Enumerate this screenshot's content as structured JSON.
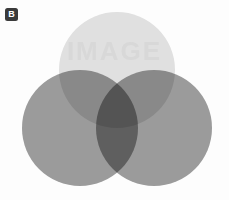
{
  "panel": {
    "label": "B",
    "background_color": "#fdfdfd"
  },
  "watermark": {
    "text": "IMAGE"
  },
  "diagram": {
    "type": "venn-3-set",
    "title": "",
    "background_color": "#fdfdfd",
    "circles": [
      {
        "id": "top",
        "name": "top-circle",
        "cx": 117,
        "cy": 70,
        "r": 58,
        "fill": "#e2e2e2",
        "label": ""
      },
      {
        "id": "left",
        "name": "left-circle",
        "cx": 80,
        "cy": 128,
        "r": 58,
        "fill": "#9c9c9c",
        "label": ""
      },
      {
        "id": "right",
        "name": "right-circle",
        "cx": 154,
        "cy": 128,
        "r": 58,
        "fill": "#9c9c9c",
        "label": ""
      }
    ],
    "regions": [
      {
        "id": "top-only",
        "sets": [
          "top"
        ],
        "color": "#e2e2e2"
      },
      {
        "id": "left-only",
        "sets": [
          "left"
        ],
        "color": "#9c9c9c"
      },
      {
        "id": "right-only",
        "sets": [
          "right"
        ],
        "color": "#9c9c9c"
      },
      {
        "id": "top-left",
        "sets": [
          "top",
          "left"
        ],
        "color": "#5e5e5e"
      },
      {
        "id": "top-right",
        "sets": [
          "top",
          "right"
        ],
        "color": "#5e5e5e"
      },
      {
        "id": "left-right",
        "sets": [
          "left",
          "right"
        ],
        "color": "#3a3a3a"
      },
      {
        "id": "all-three",
        "sets": [
          "top",
          "left",
          "right"
        ],
        "color": "#0d0d0d"
      }
    ]
  }
}
